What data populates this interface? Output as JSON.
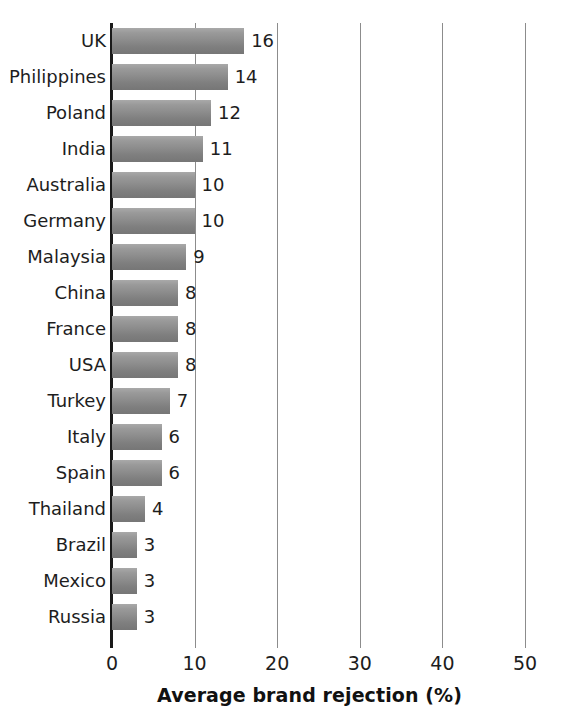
{
  "chart_data": {
    "type": "bar",
    "orientation": "horizontal",
    "title": "",
    "xlabel": "Average brand rejection (%)",
    "ylabel": "",
    "xlim": [
      0,
      50
    ],
    "xticks": [
      0,
      10,
      20,
      30,
      40,
      50
    ],
    "xtick_labels": [
      "0",
      "10",
      "20",
      "30",
      "40",
      "50"
    ],
    "grid": "vertical",
    "legend": "none",
    "bar_color": "#8d8d8d",
    "categories": [
      "UK",
      "Philippines",
      "Poland",
      "India",
      "Australia",
      "Germany",
      "Malaysia",
      "China",
      "France",
      "USA",
      "Turkey",
      "Italy",
      "Spain",
      "Thailand",
      "Brazil",
      "Mexico",
      "Russia"
    ],
    "values": [
      16,
      14,
      12,
      11,
      10,
      10,
      9,
      8,
      8,
      8,
      7,
      6,
      6,
      4,
      3,
      3,
      3
    ],
    "value_labels": [
      "16",
      "14",
      "12",
      "11",
      "10",
      "10",
      "9",
      "8",
      "8",
      "8",
      "7",
      "6",
      "6",
      "4",
      "3",
      "3",
      "3"
    ]
  },
  "axis": {
    "title": "Average brand rejection (%)"
  }
}
